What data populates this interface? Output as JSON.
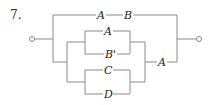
{
  "problem_number": "7.",
  "diagram": {
    "type": "switching-circuit",
    "colors": {
      "wire": "#8a8a8a",
      "label": "#222222"
    },
    "top_branch": {
      "switches": [
        "A",
        "B"
      ]
    },
    "bottom_branch": {
      "parallel_group_1": [
        "A",
        "B'"
      ],
      "parallel_group_2": [
        "C",
        "D"
      ],
      "series_switch": "A"
    },
    "labels": {
      "top_a": "A",
      "top_b": "B",
      "g1_top": "A",
      "g1_bottom": "B'",
      "g2_top": "C",
      "g2_bottom": "D",
      "series": "A"
    }
  }
}
